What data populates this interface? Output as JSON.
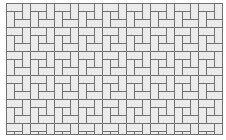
{
  "image": {
    "description": "Pinwheel tile pattern",
    "pattern": "pinwheel",
    "colors": {
      "tile_fill": "#ebebeb",
      "grout": "#707070",
      "background": "#ffffff"
    },
    "tile": {
      "rect_long": 16,
      "rect_short": 8,
      "square": 8,
      "period": 24
    }
  }
}
